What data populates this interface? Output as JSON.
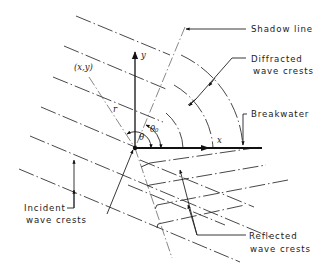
{
  "diagram": {
    "labels": {
      "shadow_line": "Shadow line",
      "diffracted_line1": "Diffracted",
      "diffracted_line2": "wave crests",
      "breakwater": "Breakwater",
      "incident_line1": "Incident",
      "incident_line2": "wave crests",
      "reflected_line1": "Reflected",
      "reflected_line2": "wave crests"
    },
    "symbols": {
      "point": "(x,y)",
      "radius": "r",
      "x_axis": "x",
      "y_axis": "y",
      "theta": "θ",
      "theta0": "θ₀"
    },
    "elements": {
      "incident_crests_count": 6,
      "reflected_crests_count": 4,
      "diffracted_arcs_count": 3,
      "origin": "breakwater tip"
    },
    "colors": {
      "line": "#111111",
      "background": "#ffffff"
    }
  }
}
